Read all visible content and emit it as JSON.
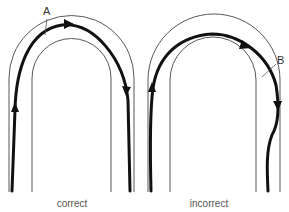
{
  "diagrams": [
    {
      "id": "correct",
      "caption": "correct",
      "marker": "A"
    },
    {
      "id": "incorrect",
      "caption": "incorrect",
      "marker": "B"
    }
  ]
}
